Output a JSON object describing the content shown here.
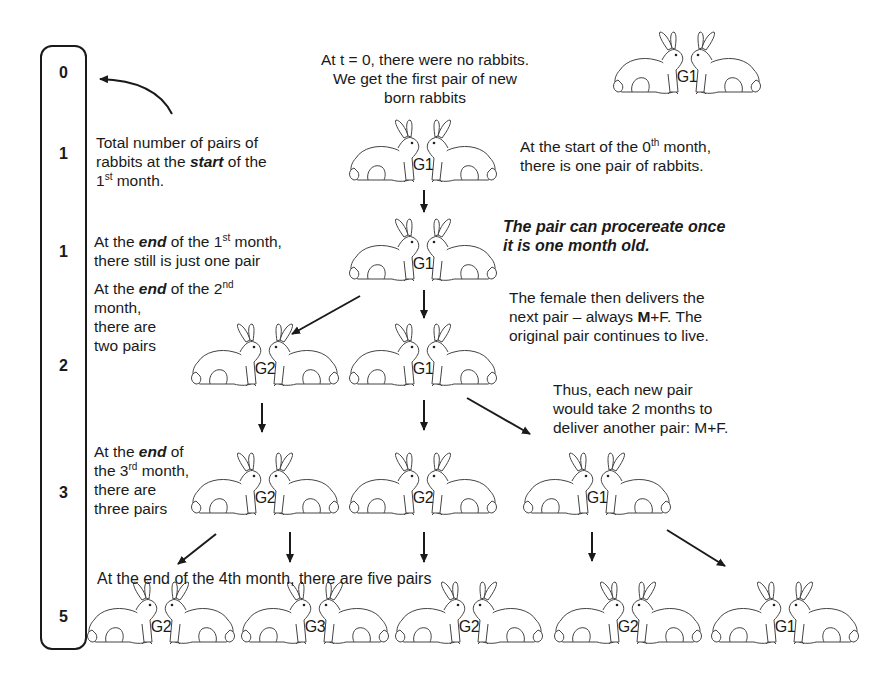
{
  "month_column": {
    "counts": [
      "0",
      "1",
      "1",
      "2",
      "3",
      "5"
    ]
  },
  "captions": {
    "intro_line1": "At t = 0, there were no rabbits.",
    "intro_line2": "We get the first pair of new",
    "intro_line3": "born rabbits",
    "total_line1": "Total number of pairs of",
    "total_line2_a": "rabbits at the ",
    "total_line2_em": "start",
    "total_line2_b": " of the",
    "total_line3_a": "1",
    "total_line3_sup": "st",
    "total_line3_b": " month.",
    "start0_line1_a": "At the start of the 0",
    "start0_line1_sup": "th",
    "start0_line1_b": " month,",
    "start0_line2": "there is one pair of rabbits.",
    "end1_line1_a": "At the ",
    "end1_line1_em": "end",
    "end1_line1_b": " of the 1",
    "end1_line1_sup": "st",
    "end1_line1_c": " month,",
    "end1_line2": "there still is just one pair",
    "procreate_line1": "The pair can procereate once",
    "procreate_line2": "it is one month old.",
    "end2_line1_a": "At  the ",
    "end2_line1_em": "end",
    "end2_line1_b": " of the 2",
    "end2_line1_sup": "nd",
    "end2_line2": "month,",
    "end2_line3": "there are",
    "end2_line4": "two pairs",
    "female_line1": "The female then delivers the",
    "female_line2_a": "next pair – always ",
    "female_line2_bold": "M",
    "female_line2_b": "+F. The",
    "female_line3": "original pair continues to live.",
    "thus_line1": "Thus, each new pair",
    "thus_line2": "would take 2 months to",
    "thus_line3": "deliver another pair: M+F.",
    "end3_line1_a": "At the ",
    "end3_line1_em": "end",
    "end3_line1_b": " of",
    "end3_line2_a": "the 3",
    "end3_line2_sup": "rd",
    "end3_line2_b": " month,",
    "end3_line3": "there are",
    "end3_line4": "three pairs",
    "end4": "At the end of the 4th month, there are five pairs"
  },
  "rabbit_pairs": [
    {
      "id": "top",
      "generation": "G1"
    },
    {
      "id": "month1-start",
      "generation": "G1"
    },
    {
      "id": "month1-end",
      "generation": "G1"
    },
    {
      "id": "month2-a",
      "generation": "G2"
    },
    {
      "id": "month2-b",
      "generation": "G1"
    },
    {
      "id": "month3-a",
      "generation": "G2"
    },
    {
      "id": "month3-b",
      "generation": "G2"
    },
    {
      "id": "month3-c",
      "generation": "G1"
    },
    {
      "id": "month4-a",
      "generation": "G2"
    },
    {
      "id": "month4-b",
      "generation": "G3"
    },
    {
      "id": "month4-c",
      "generation": "G2"
    },
    {
      "id": "month4-d",
      "generation": "G2"
    },
    {
      "id": "month4-e",
      "generation": "G1"
    }
  ]
}
